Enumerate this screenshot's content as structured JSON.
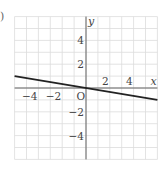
{
  "problem_marker": ")",
  "chart_data": {
    "type": "line",
    "title": "",
    "xlabel": "x",
    "ylabel": "y",
    "origin_label": "O",
    "xlim": [
      -6,
      6
    ],
    "ylim": [
      -6,
      6
    ],
    "grid": true,
    "grid_step": 1,
    "x_ticks": [
      -4,
      -2,
      2,
      4
    ],
    "y_ticks": [
      4,
      2,
      -2,
      -4
    ],
    "x_tick_labels": [
      "−4",
      "−2",
      "2",
      "4"
    ],
    "y_tick_labels": [
      "4",
      "2",
      "−2",
      "−4"
    ],
    "series": [
      {
        "name": "line",
        "equation": "y = -x/6",
        "x": [
          -6,
          6
        ],
        "y": [
          1,
          -1
        ],
        "color": "#222222"
      }
    ]
  }
}
